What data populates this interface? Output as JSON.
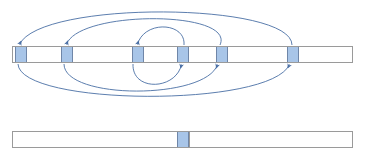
{
  "figure": {
    "title": "",
    "kind": "array-permutation-diagram",
    "colors": {
      "strip_fill": "#ffffff",
      "strip_border": "#9a9a9a",
      "cell_fill": "#a8c5e8",
      "cell_border": "#6f86a8",
      "arc_stroke": "#4a6fa5",
      "background": "#ffffff"
    }
  },
  "top_array": {
    "label": "top-array",
    "x": 12,
    "y": 46,
    "width": 341,
    "height": 17,
    "dividers": [
      60,
      131,
      176,
      215,
      286
    ],
    "cells": [
      {
        "id": "cell-1",
        "x": 14,
        "width": 12,
        "filled": true,
        "value": ""
      },
      {
        "id": "cell-2",
        "x": 60,
        "width": 12,
        "filled": true,
        "value": ""
      },
      {
        "id": "cell-3",
        "x": 131,
        "width": 12,
        "filled": true,
        "value": ""
      },
      {
        "id": "cell-4",
        "x": 176,
        "width": 12,
        "filled": true,
        "value": ""
      },
      {
        "id": "cell-5",
        "x": 215,
        "width": 12,
        "filled": true,
        "value": ""
      },
      {
        "id": "cell-6",
        "x": 286,
        "width": 12,
        "filled": true,
        "value": ""
      }
    ]
  },
  "bottom_array": {
    "label": "bottom-array",
    "x": 12,
    "y": 131,
    "width": 341,
    "height": 17,
    "dividers": [
      188
    ],
    "cells": [
      {
        "id": "cell-1",
        "x": 176,
        "width": 12,
        "filled": true,
        "value": ""
      }
    ]
  },
  "arcs_above": [
    {
      "id": "arc-above-1",
      "from_x": 290,
      "to_x": 19,
      "apex_y": 10,
      "direction": "right-to-left"
    },
    {
      "id": "arc-above-2",
      "from_x": 218,
      "to_x": 66,
      "apex_y": 22,
      "direction": "right-to-left"
    },
    {
      "id": "arc-above-3",
      "from_x": 182,
      "to_x": 137,
      "apex_y": 31,
      "direction": "right-to-left"
    }
  ],
  "arcs_below": [
    {
      "id": "arc-below-1",
      "from_x": 19,
      "to_x": 290,
      "apex_y": 99,
      "direction": "left-to-right"
    },
    {
      "id": "arc-below-2",
      "from_x": 66,
      "to_x": 218,
      "apex_y": 93,
      "direction": "left-to-right"
    },
    {
      "id": "arc-below-3",
      "from_x": 137,
      "to_x": 182,
      "apex_y": 85,
      "direction": "left-to-right"
    }
  ]
}
